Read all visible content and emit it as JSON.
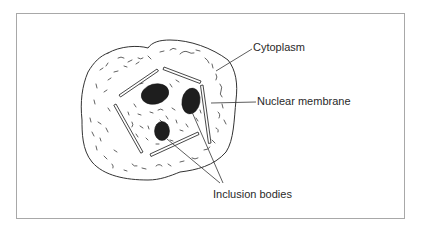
{
  "figure": {
    "frame_color": "#a8a8a8",
    "ink_color": "#333333",
    "inclusion_body_color": "#1e1e1e"
  },
  "labels": {
    "cytoplasm": "Cytoplasm",
    "nuclear_membrane": "Nuclear membrane",
    "inclusion_bodies": "Inclusion bodies"
  },
  "structures": {
    "cell": "cell-outline",
    "nucleus": "nuclear-membrane-segments",
    "inclusion_body_count": 3
  }
}
